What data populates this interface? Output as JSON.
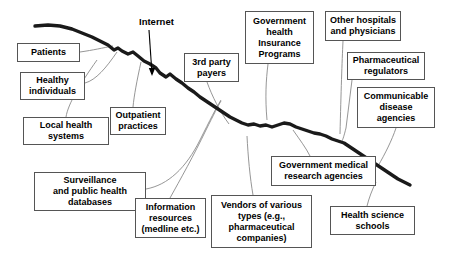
{
  "diagram": {
    "backbone_label": "Internet",
    "colors": {
      "backbone": "#1a1a1a",
      "connector": "#8a8a8a",
      "box_border": "#555555",
      "text": "#000000",
      "background": "#ffffff"
    },
    "free_labels": [
      {
        "name": "internet-label",
        "text": "Internet",
        "x": 139,
        "y": 16
      }
    ],
    "nodes": [
      {
        "name": "patients",
        "text": "Patients",
        "x": 17,
        "y": 43,
        "w": 63,
        "h": 19
      },
      {
        "name": "healthy-individuals",
        "text": "Healthy\nindividuals",
        "x": 20,
        "y": 72,
        "w": 65,
        "h": 28
      },
      {
        "name": "local-health-systems",
        "text": "Local health\nsystems",
        "x": 23,
        "y": 117,
        "w": 86,
        "h": 28
      },
      {
        "name": "surveillance-databases",
        "text": "Surveillance\nand public health\ndatabases",
        "x": 34,
        "y": 172,
        "w": 112,
        "h": 39
      },
      {
        "name": "outpatient-practices",
        "text": "Outpatient\npractices",
        "x": 110,
        "y": 107,
        "w": 56,
        "h": 28
      },
      {
        "name": "information-resources",
        "text": "Information\nresources\n(medline etc.)",
        "x": 135,
        "y": 198,
        "w": 71,
        "h": 40
      },
      {
        "name": "third-party-payers",
        "text": "3rd party\npayers",
        "x": 184,
        "y": 53,
        "w": 55,
        "h": 29
      },
      {
        "name": "vendors",
        "text": "Vendors of various\ntypes (e.g.,\npharmaceutical\ncompanies)",
        "x": 211,
        "y": 195,
        "w": 101,
        "h": 53
      },
      {
        "name": "government-health-insurance",
        "text": "Government\nhealth\nInsurance\nPrograms",
        "x": 245,
        "y": 11,
        "w": 69,
        "h": 53
      },
      {
        "name": "government-medical-research",
        "text": "Government medical\nresearch agencies",
        "x": 271,
        "y": 156,
        "w": 105,
        "h": 30
      },
      {
        "name": "other-hospitals",
        "text": "Other hospitals\nand physicians",
        "x": 325,
        "y": 11,
        "w": 76,
        "h": 30
      },
      {
        "name": "pharmaceutical-regulators",
        "text": "Pharmaceutical\nregulators",
        "x": 347,
        "y": 52,
        "w": 78,
        "h": 28
      },
      {
        "name": "communicable-disease",
        "text": "Communicable\ndisease\nagencies",
        "x": 357,
        "y": 87,
        "w": 78,
        "h": 41
      },
      {
        "name": "health-science-schools",
        "text": "Health science\nschools",
        "x": 330,
        "y": 206,
        "w": 85,
        "h": 29
      }
    ],
    "backbone_path": "M 35 26 L 48 25 L 60 26 L 72 29 L 82 33 L 92 37 L 100 41 L 108 45 L 114 50 L 118 48 L 122 51 L 128 54 L 133 52 L 138 56 L 144 61 L 150 64 L 156 68 L 160 73 L 166 77 L 170 74 L 176 79 L 182 83 L 188 88 L 194 92 L 200 97 L 206 101 L 212 105 L 218 109 L 224 113 L 230 117 L 236 120 L 242 123 L 248 125 L 254 124 L 260 126 L 266 125 L 272 127 L 278 125 L 284 123 L 290 124 L 296 127 L 302 129 L 308 131 L 314 133 L 320 134 L 326 136 L 332 139 L 338 141 L 344 143 L 350 147 L 356 151 L 362 155 L 368 159 L 374 163 L 380 167 L 386 171 L 392 175 L 398 179 L 404 182 L 410 185",
    "internet_arrow": {
      "x1": 149,
      "y1": 30,
      "x2": 152,
      "y2": 74
    },
    "connectors": [
      {
        "name": "connector-patients",
        "d": "M 80 52 C 94 50, 102 48, 113 46"
      },
      {
        "name": "connector-healthy-individuals",
        "d": "M 85 83 C 96 80, 106 68, 117 52"
      },
      {
        "name": "connector-local-health-systems",
        "d": "M 66 117 C 68 104, 80 84, 97 60"
      },
      {
        "name": "connector-surveillance",
        "d": "M 146 189 C 168 185, 186 168, 200 140 C 210 120, 216 108, 221 100"
      },
      {
        "name": "connector-outpatient-practices",
        "d": "M 133 107 C 134 96, 137 80, 141 62"
      },
      {
        "name": "connector-information-resources",
        "d": "M 170 198 C 180 180, 194 155, 206 130 C 214 114, 218 106, 221 101"
      },
      {
        "name": "connector-third-party-payers",
        "d": "M 207 82 C 212 96, 220 112, 229 124"
      },
      {
        "name": "connector-vendors",
        "d": "M 253 195 C 250 178, 248 156, 247 136"
      },
      {
        "name": "connector-government-health-insurance",
        "d": "M 268 64 C 266 80, 265 98, 267 120"
      },
      {
        "name": "connector-government-medical-research",
        "d": "M 310 156 C 306 148, 300 140, 293 130"
      },
      {
        "name": "connector-other-hospitals",
        "d": "M 343 41 C 342 62, 341 92, 340 134"
      },
      {
        "name": "connector-pharmaceutical-regulators",
        "d": "M 352 80 C 350 96, 348 112, 346 128 C 344 136, 343 139, 342 141"
      },
      {
        "name": "connector-communicable-disease",
        "d": "M 396 128 C 392 140, 385 154, 378 166"
      },
      {
        "name": "connector-health-science-schools",
        "d": "M 367 206 C 369 198, 372 190, 376 182"
      }
    ]
  }
}
